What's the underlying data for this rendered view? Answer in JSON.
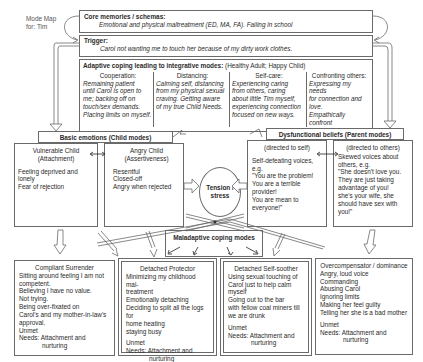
{
  "mode_map_label": [
    "Mode Map",
    "for: Tim"
  ],
  "core": {
    "title": "Core memories / schemas:",
    "text": "Emotional and physical maltreatment (ED, MA, FA). Failing in school"
  },
  "trigger": {
    "title": "Trigger:",
    "text": "Carol not wanting me to touch her because of my dirty work clothes."
  },
  "adaptive": {
    "title": "Adaptive coping leading to integrative modes:",
    "subtitle": "(Healthy Adult; Happy Child)",
    "columns": [
      {
        "heading": "Cooperation:",
        "lines": [
          "Remaining patient",
          "until Carol is open to",
          "me; backing off on",
          "touch/sex demands.",
          "Placing limits on myself."
        ]
      },
      {
        "heading": "Distancing:",
        "lines": [
          "Calming self, distancing",
          "from my physical sexual",
          "craving. Getting aware",
          "of my true Child Needs."
        ]
      },
      {
        "heading": "Self-care:",
        "lines": [
          "Experiencing caring",
          "from others, caring",
          "about little Tim myself,",
          "experiencing connection",
          "focused on new ways."
        ]
      },
      {
        "heading": "Confronting others:",
        "lines": [
          "Expressing my needs",
          "for connection and love.",
          "Empathically confront",
          "when Carol avoids."
        ]
      }
    ]
  },
  "basic_emotions": {
    "title": "Basic emotions (Child modes)",
    "vulnerable": {
      "title": "Vulnerable Child",
      "subtitle": "(Attachment)",
      "lines": [
        "Feeling deprived and lonely",
        "Fear of rejection"
      ]
    },
    "angry": {
      "title": "Angry Child",
      "subtitle": "(Assertiveness)",
      "lines": [
        "Resentful",
        "Closed-off",
        "Angry when rejected"
      ]
    }
  },
  "dysfunctional": {
    "title": "Dysfunctional  beliefs  (Parent modes)",
    "self": {
      "heading": "(directed to self)",
      "lines": [
        "Self-defeating voices, e.g.",
        "\"You are the problem!",
        "You are a terrible provider!",
        "You are mean to",
        "everyone!\""
      ]
    },
    "others": {
      "heading": "(directed to others)",
      "lines": [
        "Skewed voices about",
        "others, e.g.",
        "\"She doesn't love you.",
        "They are just taking",
        "advantage of you!",
        "she's your wife, she",
        "should have sex with",
        "you!\""
      ]
    }
  },
  "tension": {
    "lines": [
      "Tension /",
      "stress"
    ]
  },
  "maladaptive": {
    "title": "Maladaptive coping modes"
  },
  "coping_boxes": [
    {
      "title": "Compliant Surrender",
      "lines": [
        "Sitting around feeling I am not",
        "competent.",
        "Believing I have no value.",
        "Not trying.",
        "Being over-fixated on",
        "Carol's and my mother-in-law's",
        "approval."
      ],
      "unmet": "Unmet",
      "needs_label": "Needs:",
      "needs": [
        "Attachment and",
        "nurturing"
      ]
    },
    {
      "title": "Detached Protector",
      "lines": [
        "Minimizing my childhood mal-",
        "treatment",
        "Emotionally detaching",
        "Deciding to split all the logs for",
        "home heating",
        "staying busy"
      ],
      "unmet": "Unmet",
      "needs_label": "Needs:",
      "needs": [
        "Attachment and",
        "nurturing"
      ]
    },
    {
      "title": "Detached Self-soother",
      "lines": [
        "Using sexual  touching of",
        "Carol just to help calm",
        "myself",
        "Going out to the bar",
        "with fellow coal miners till",
        "we are drunk"
      ],
      "unmet": "Unmet",
      "needs_label": "Needs:",
      "needs": [
        "Attachment and",
        "nurturing"
      ]
    },
    {
      "title": "Overcompensator / dominance",
      "lines": [
        "Angry, loud voice",
        "Commanding",
        "Abusing Carol",
        "Ignoring limits",
        "Making her feel guilty",
        "Telling her she is a bad mother"
      ],
      "unmet": "Unmet",
      "needs_label": "Needs:",
      "needs": [
        "Attachment and",
        "nurturing"
      ]
    }
  ],
  "colors": {
    "line": "#6a6a6a",
    "text": "#2a2a2a",
    "background": "#ffffff"
  }
}
